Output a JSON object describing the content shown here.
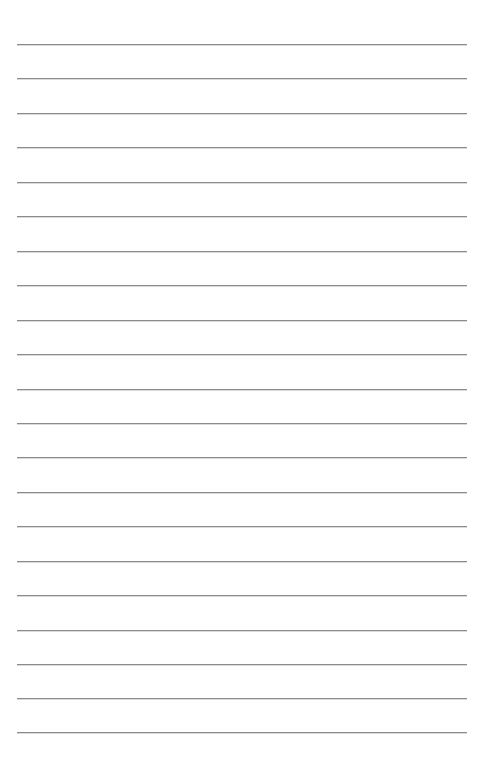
{
  "document": {
    "kind": "lined-paper",
    "title": "Blank Lined Paper",
    "page_width": 490,
    "page_height": 770,
    "background_color": "#ffffff",
    "has_text": false,
    "has_header": false,
    "has_margin_line": false,
    "body_text": ""
  },
  "ruling": {
    "line_color": "#8c8c8c",
    "line_thickness_px": 1,
    "line_count": 21,
    "line_spacing_px": 34.4,
    "first_line_y": 44,
    "last_line_y": 732,
    "line_start_x": 17,
    "line_end_x": 467,
    "line_length_px": 450,
    "left_margin_px": 17,
    "right_margin_px": 23,
    "top_margin_px": 44,
    "bottom_margin_px": 38,
    "lines": [
      {
        "index": 1,
        "y": 44,
        "x1": 17,
        "x2": 467,
        "content": ""
      },
      {
        "index": 2,
        "y": 78,
        "x1": 17,
        "x2": 467,
        "content": ""
      },
      {
        "index": 3,
        "y": 113,
        "x1": 17,
        "x2": 467,
        "content": ""
      },
      {
        "index": 4,
        "y": 147,
        "x1": 17,
        "x2": 467,
        "content": ""
      },
      {
        "index": 5,
        "y": 182,
        "x1": 17,
        "x2": 467,
        "content": ""
      },
      {
        "index": 6,
        "y": 216,
        "x1": 17,
        "x2": 467,
        "content": ""
      },
      {
        "index": 7,
        "y": 251,
        "x1": 17,
        "x2": 467,
        "content": ""
      },
      {
        "index": 8,
        "y": 285,
        "x1": 17,
        "x2": 467,
        "content": ""
      },
      {
        "index": 9,
        "y": 320,
        "x1": 17,
        "x2": 467,
        "content": ""
      },
      {
        "index": 10,
        "y": 354,
        "x1": 17,
        "x2": 467,
        "content": ""
      },
      {
        "index": 11,
        "y": 389,
        "x1": 17,
        "x2": 467,
        "content": ""
      },
      {
        "index": 12,
        "y": 423,
        "x1": 17,
        "x2": 467,
        "content": ""
      },
      {
        "index": 13,
        "y": 457,
        "x1": 17,
        "x2": 467,
        "content": ""
      },
      {
        "index": 14,
        "y": 492,
        "x1": 17,
        "x2": 467,
        "content": ""
      },
      {
        "index": 15,
        "y": 526,
        "x1": 17,
        "x2": 467,
        "content": ""
      },
      {
        "index": 16,
        "y": 561,
        "x1": 17,
        "x2": 467,
        "content": ""
      },
      {
        "index": 17,
        "y": 595,
        "x1": 17,
        "x2": 467,
        "content": ""
      },
      {
        "index": 18,
        "y": 630,
        "x1": 17,
        "x2": 467,
        "content": ""
      },
      {
        "index": 19,
        "y": 664,
        "x1": 17,
        "x2": 467,
        "content": ""
      },
      {
        "index": 20,
        "y": 698,
        "x1": 17,
        "x2": 467,
        "content": ""
      },
      {
        "index": 21,
        "y": 732,
        "x1": 17,
        "x2": 467,
        "content": ""
      }
    ]
  }
}
